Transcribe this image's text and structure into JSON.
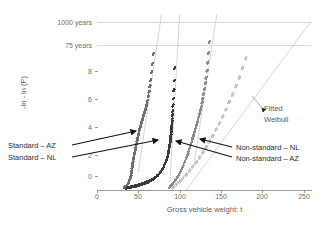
{
  "chart_data": {
    "type": "scatter",
    "title": "",
    "xlabel": "Gross vehicle weight: t",
    "ylabel": "-ln - ln (P)",
    "xlim": [
      0,
      260
    ],
    "ylim": [
      -1.5,
      11.2
    ],
    "xticks": [
      0,
      50,
      100,
      150,
      200,
      250
    ],
    "yticks": [
      0,
      2,
      4,
      6,
      8
    ],
    "grid": "horizontal-reference-lines-only",
    "legend": "inline-annotations",
    "reference_lines": [
      {
        "label": "1000 years",
        "y": 10.6
      },
      {
        "label": "75 years",
        "y": 8.9
      }
    ],
    "annotations": [
      {
        "text": "Standard – AZ",
        "position": "left"
      },
      {
        "text": "Standard – NL",
        "position": "left"
      },
      {
        "text": "Non-standard – NL",
        "position": "right"
      },
      {
        "text": "Non-standard – AZ",
        "position": "right"
      },
      {
        "text": "Fitted Weibull",
        "position": "right-upper"
      }
    ],
    "series": [
      {
        "name": "Standard – AZ",
        "marker": "dot",
        "color": "#6e6e6e",
        "x": [
          33,
          35,
          36,
          37,
          38,
          39,
          40,
          41,
          41.5,
          42,
          42.5,
          43,
          43.5,
          44,
          44.5,
          45,
          45.5,
          46,
          46.5,
          47,
          47.5,
          48,
          48.5,
          49,
          49.5,
          50,
          50.5,
          51,
          51.5,
          52,
          52.5,
          53,
          53.5,
          54,
          54.5,
          55,
          55.5,
          56,
          56.5,
          57,
          57.5,
          58,
          58.5,
          59,
          59.5,
          60,
          61,
          62,
          63,
          64,
          65,
          66,
          67,
          68
        ],
        "y": [
          -1.3,
          -1.25,
          -1.2,
          -1.1,
          -1.0,
          -0.85,
          -0.7,
          -0.5,
          -0.3,
          -0.1,
          0.1,
          0.3,
          0.5,
          0.7,
          0.85,
          1.0,
          1.15,
          1.3,
          1.45,
          1.6,
          1.75,
          1.9,
          2.05,
          2.2,
          2.35,
          2.5,
          2.62,
          2.74,
          2.86,
          2.98,
          3.1,
          3.2,
          3.3,
          3.4,
          3.5,
          3.6,
          3.7,
          3.8,
          3.9,
          4.0,
          4.1,
          4.2,
          4.3,
          4.4,
          4.5,
          4.65,
          4.95,
          5.25,
          5.6,
          6.0,
          6.45,
          7.0,
          7.6,
          8.3
        ]
      },
      {
        "name": "Standard – NL",
        "marker": "dot",
        "color": "#3a3a3a",
        "x": [
          36,
          38,
          40,
          42,
          44,
          46,
          48,
          50,
          52,
          54,
          56,
          58,
          60,
          62,
          64,
          66,
          68,
          70,
          72,
          74,
          76,
          78,
          80,
          82,
          83,
          84,
          85,
          85.5,
          86,
          86.5,
          87,
          87.5,
          88,
          88.3,
          88.6,
          88.9,
          89.2,
          89.5,
          89.8,
          90,
          90.2,
          90.4,
          90.6,
          90.8,
          91,
          91.3,
          91.6,
          92,
          92.5,
          93,
          93.5,
          94
        ],
        "y": [
          -1.35,
          -1.32,
          -1.3,
          -1.27,
          -1.25,
          -1.22,
          -1.2,
          -1.16,
          -1.12,
          -1.08,
          -1.04,
          -1.0,
          -0.95,
          -0.9,
          -0.84,
          -0.78,
          -0.7,
          -0.62,
          -0.52,
          -0.4,
          -0.26,
          -0.1,
          0.1,
          0.35,
          0.5,
          0.65,
          0.82,
          0.95,
          1.1,
          1.25,
          1.4,
          1.55,
          1.72,
          1.85,
          2.0,
          2.15,
          2.3,
          2.45,
          2.6,
          2.75,
          2.9,
          3.05,
          3.2,
          3.4,
          3.6,
          3.9,
          4.2,
          4.6,
          5.1,
          5.7,
          6.4,
          7.3
        ]
      },
      {
        "name": "Non-standard – NL",
        "marker": "dot",
        "color": "#8c8c8c",
        "x": [
          88,
          90,
          92,
          94,
          96,
          98,
          100,
          102,
          104,
          106,
          108,
          110,
          111,
          112,
          113,
          114,
          115,
          116,
          117,
          118,
          119,
          120,
          121,
          122,
          123,
          124,
          125,
          126,
          127,
          128,
          129,
          130,
          131,
          132,
          133,
          134,
          135,
          136
        ],
        "y": [
          -1.3,
          -1.15,
          -1.0,
          -0.85,
          -0.7,
          -0.5,
          -0.3,
          -0.05,
          0.2,
          0.5,
          0.8,
          1.1,
          1.3,
          1.5,
          1.7,
          1.9,
          2.1,
          2.3,
          2.5,
          2.7,
          2.9,
          3.1,
          3.3,
          3.5,
          3.75,
          4.0,
          4.25,
          4.5,
          4.8,
          5.1,
          5.45,
          5.8,
          6.2,
          6.6,
          7.1,
          7.7,
          8.4,
          9.2
        ]
      },
      {
        "name": "Non-standard – AZ",
        "marker": "open-diamond",
        "color": "#b8b8b8",
        "x": [
          92,
          96,
          100,
          104,
          108,
          112,
          116,
          120,
          124,
          128,
          132,
          136,
          140,
          144,
          148,
          152,
          156,
          160,
          164,
          168,
          172,
          176,
          180
        ],
        "y": [
          -1.3,
          -1.1,
          -0.9,
          -0.65,
          -0.4,
          -0.1,
          0.2,
          0.5,
          0.85,
          1.2,
          1.6,
          2.0,
          2.4,
          2.85,
          3.3,
          3.8,
          4.3,
          4.85,
          5.4,
          6.0,
          6.6,
          7.3,
          8.0
        ]
      }
    ],
    "fitted_weibull_lines": [
      {
        "name": "Standard – AZ fit",
        "x": [
          50,
          78
        ],
        "y": [
          -0.2,
          11.2
        ]
      },
      {
        "name": "Standard – NL fit",
        "x": [
          88,
          100
        ],
        "y": [
          -1.0,
          11.2
        ]
      },
      {
        "name": "Non-standard – NL fit",
        "x": [
          118,
          145
        ],
        "y": [
          0.6,
          11.2
        ]
      },
      {
        "name": "Non-standard – AZ fit",
        "x": [
          108,
          258
        ],
        "y": [
          -1.5,
          10.6
        ]
      }
    ]
  },
  "axes": {
    "x_title": "Gross vehicle weight: t",
    "y_title": "-ln - ln (P)",
    "x_ticks": [
      "0",
      "50",
      "100",
      "150",
      "200",
      "250"
    ],
    "y_ticks": [
      "0",
      "2",
      "4",
      "6",
      "8"
    ],
    "reference_labels": [
      "1000 years",
      "75 years"
    ]
  },
  "annotations": {
    "standard_az": "Standard – AZ",
    "standard_nl": "Standard – NL",
    "nonstandard_nl": "Non-standard – NL",
    "nonstandard_az": "Non-standard – AZ",
    "fitted_line1": "Fitted",
    "fitted_line2": "Weibull"
  },
  "colors": {
    "grid": "#d9d9e2",
    "axis": "#9a9a9a",
    "text": "#5c5c5c",
    "anno_text": "#2b2b2b",
    "series_standard_az": "#6e6e6e",
    "series_standard_nl": "#3a3a3a",
    "series_nonstandard_nl": "#8c8c8c",
    "series_nonstandard_az": "#b8b8b8"
  }
}
